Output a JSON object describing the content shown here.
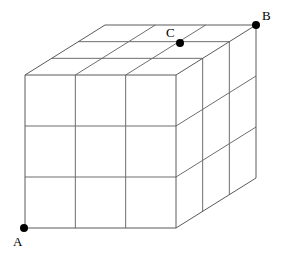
{
  "figure": {
    "type": "geometry-diagram",
    "background_color": "#ffffff",
    "edge_color": "#5a5a5a",
    "grid_color": "#6e6e6e",
    "vertex_color": "#000000",
    "projection": {
      "front_face": {
        "left_x": 25,
        "right_x": 176,
        "top_y": 75,
        "bottom_y": 228,
        "divisions": 3
      },
      "depth_vector": {
        "dx": 80,
        "dy": -50
      },
      "depth_divisions": 3
    },
    "labels": [
      {
        "name": "A",
        "text": "A",
        "dot_x": 24,
        "dot_y": 228,
        "dot_radius": 4,
        "label_x": 13,
        "label_y": 235
      },
      {
        "name": "B",
        "text": "B",
        "dot_x": 256,
        "dot_y": 25,
        "dot_radius": 4,
        "label_x": 262,
        "label_y": 9
      },
      {
        "name": "C",
        "text": "C",
        "dot_x": 180,
        "dot_y": 43,
        "dot_radius": 4,
        "label_x": 166,
        "label_y": 26
      }
    ]
  }
}
